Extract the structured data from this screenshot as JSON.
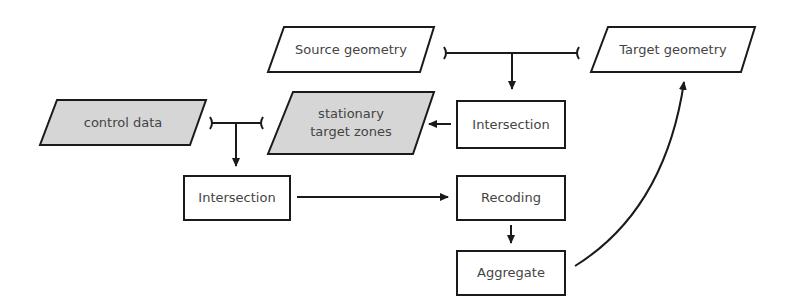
{
  "colors": {
    "stroke": "#1a1a1a",
    "shaded_fill": "#d6d6d6",
    "plain_fill": "#ffffff",
    "text": "#444444"
  },
  "nodes": {
    "source_geometry": {
      "label": "Source geometry",
      "shape": "parallelogram",
      "shaded": false
    },
    "target_geometry": {
      "label": "Target geometry",
      "shape": "parallelogram",
      "shaded": false
    },
    "intersection_right": {
      "label": "Intersection",
      "shape": "rectangle"
    },
    "stationary_target_zones": {
      "line1": "stationary",
      "line2": "target zones",
      "shape": "parallelogram",
      "shaded": true
    },
    "control_data": {
      "label": "control data",
      "shape": "parallelogram",
      "shaded": true
    },
    "intersection_left": {
      "label": "Intersection",
      "shape": "rectangle"
    },
    "recoding": {
      "label": "Recoding",
      "shape": "rectangle"
    },
    "aggregate": {
      "label": "Aggregate",
      "shape": "rectangle"
    }
  },
  "edges": [
    {
      "from": [
        "source_geometry",
        "target_geometry"
      ],
      "to": "intersection_right",
      "type": "join"
    },
    {
      "from": "intersection_right",
      "to": "stationary_target_zones",
      "type": "arrow"
    },
    {
      "from": [
        "control_data",
        "stationary_target_zones"
      ],
      "to": "intersection_left",
      "type": "join"
    },
    {
      "from": "intersection_left",
      "to": "recoding",
      "type": "arrow"
    },
    {
      "from": "recoding",
      "to": "aggregate",
      "type": "arrow"
    },
    {
      "from": "aggregate",
      "to": "target_geometry",
      "type": "curved-arrow"
    }
  ]
}
